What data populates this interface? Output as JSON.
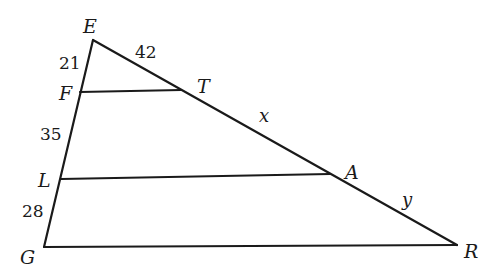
{
  "diagram": {
    "type": "geometry-triangle-parallel-lines",
    "vertices": {
      "E": "E",
      "F": "F",
      "T": "T",
      "L": "L",
      "A": "A",
      "G": "G",
      "R": "R"
    },
    "segments": [
      {
        "id": "EG",
        "from": "E",
        "to": "G"
      },
      {
        "id": "ER",
        "from": "E",
        "to": "R"
      },
      {
        "id": "FT",
        "from": "F",
        "to": "T"
      },
      {
        "id": "LA",
        "from": "L",
        "to": "A"
      },
      {
        "id": "GR",
        "from": "G",
        "to": "R"
      }
    ],
    "measures": {
      "EF": "21",
      "ET": "42",
      "FL": "35",
      "LG": "28",
      "TA": "x",
      "AR": "y"
    }
  }
}
